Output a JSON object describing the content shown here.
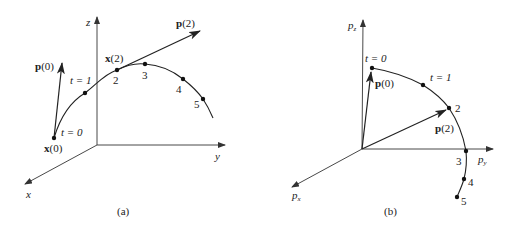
{
  "figure": {
    "panels": [
      {
        "id": "a",
        "caption": "(a)",
        "axes": {
          "z": "z",
          "y": "y",
          "x": "x"
        },
        "curve_points": [
          {
            "label": "t = 0",
            "x": 54,
            "y": 138
          },
          {
            "label": "t = 1",
            "x": 85,
            "y": 93
          },
          {
            "label": "2",
            "x": 117,
            "y": 70
          },
          {
            "label": "3",
            "x": 145,
            "y": 64
          },
          {
            "label": "4",
            "x": 183,
            "y": 79
          },
          {
            "label": "5",
            "x": 203,
            "y": 99
          }
        ],
        "vector_labels": {
          "p0_bold": "p",
          "p0_arg": "(0)",
          "p2_bold": "p",
          "p2_arg": "(2)"
        },
        "point_labels": {
          "x0_bold": "x",
          "x0_arg": "(0)",
          "x2_bold": "x",
          "x2_arg": "(2)"
        },
        "tick_labels": {
          "t0": "t = 0",
          "t1": "t = 1",
          "n2": "2",
          "n3": "3",
          "n4": "4",
          "n5": "5"
        }
      },
      {
        "id": "b",
        "caption": "(b)",
        "axes": {
          "z_base": "p",
          "z_sub": "z",
          "y_base": "p",
          "y_sub": "y",
          "x_base": "p",
          "x_sub": "x"
        },
        "curve_points": [
          {
            "label": "t = 0",
            "x": 372,
            "y": 68
          },
          {
            "label": "t = 1",
            "x": 423,
            "y": 85
          },
          {
            "label": "2",
            "x": 449,
            "y": 108
          },
          {
            "label": "3",
            "x": 466,
            "y": 151
          },
          {
            "label": "4",
            "x": 464,
            "y": 179
          },
          {
            "label": "5",
            "x": 457,
            "y": 197
          }
        ],
        "vector_labels": {
          "p0_bold": "p",
          "p0_arg": "(0)",
          "p2_bold": "p",
          "p2_arg": "(2)"
        },
        "tick_labels": {
          "t0": "t = 0",
          "t1": "t = 1",
          "n2": "2",
          "n3": "3",
          "n4": "4",
          "n5": "5"
        }
      }
    ],
    "colors": {
      "ink": "#222222",
      "axis": "#333333",
      "background": "#ffffff"
    }
  }
}
